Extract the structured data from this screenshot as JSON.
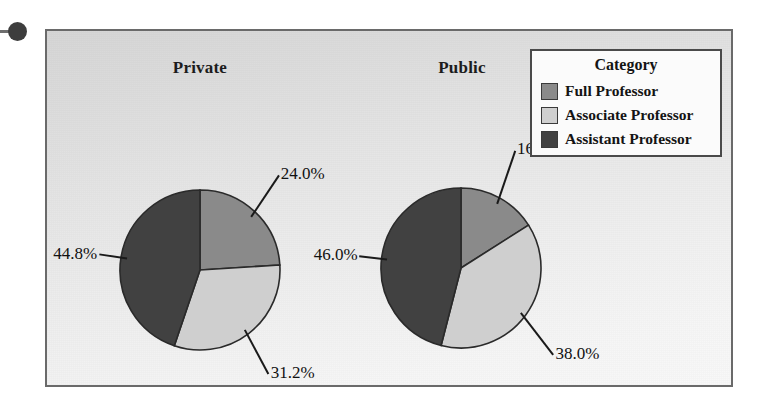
{
  "figure": {
    "legend_title": "Category",
    "artifact_line_name": "scan-artifact-rule",
    "artifact_dot_name": "scan-artifact-dot"
  },
  "colors": {
    "full_professor": "#8a8a8a",
    "associate_professor": "#cfcfcf",
    "assistant_professor": "#414141",
    "slice_outline": "#2a2a2a",
    "frame_border": "#6a6a6a",
    "legend_border": "#4a4a4a",
    "text": "#141414"
  },
  "legend": {
    "title": "Category",
    "items": [
      {
        "label": "Full Professor",
        "color": "#8a8a8a"
      },
      {
        "label": "Associate Professor",
        "color": "#cfcfcf"
      },
      {
        "label": "Assistant Professor",
        "color": "#414141"
      }
    ]
  },
  "panels": [
    {
      "title": "Private",
      "labels": [
        "24.0%",
        "31.2%",
        "44.8%"
      ]
    },
    {
      "title": "Public",
      "labels": [
        "16.0%",
        "38.0%",
        "46.0%"
      ]
    }
  ],
  "chart_data": [
    {
      "type": "pie",
      "title": "Private",
      "categories": [
        "Full Professor",
        "Associate Professor",
        "Assistant Professor"
      ],
      "values": [
        24.0,
        31.2,
        44.8
      ],
      "data_labels": [
        "24.0%",
        "31.2%",
        "44.8%"
      ],
      "colors": [
        "#8a8a8a",
        "#cfcfcf",
        "#414141"
      ],
      "start_angle": 0,
      "direction": "clockwise",
      "legend": "Category",
      "legend_position": "top-right"
    },
    {
      "type": "pie",
      "title": "Public",
      "categories": [
        "Full Professor",
        "Associate Professor",
        "Assistant Professor"
      ],
      "values": [
        16.0,
        38.0,
        46.0
      ],
      "data_labels": [
        "16.0%",
        "38.0%",
        "46.0%"
      ],
      "colors": [
        "#8a8a8a",
        "#cfcfcf",
        "#414141"
      ],
      "start_angle": 0,
      "direction": "clockwise",
      "legend": "Category",
      "legend_position": "top-right"
    }
  ]
}
